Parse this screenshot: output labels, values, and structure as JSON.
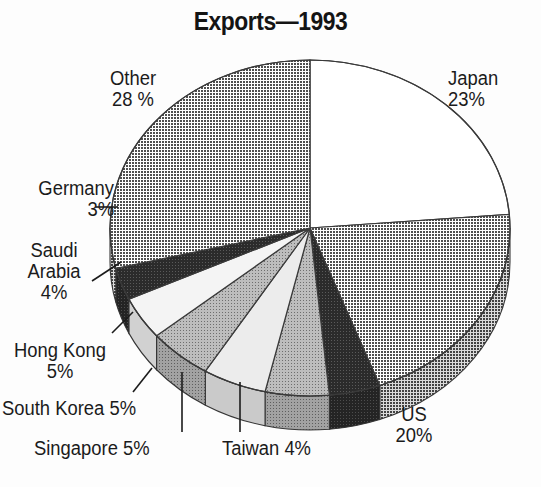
{
  "title": "Exports—1993",
  "chart_data": {
    "type": "pie",
    "title": "Exports—1993",
    "xlabel": "",
    "ylabel": "",
    "legend_position": "none",
    "grid": false,
    "unit": "%",
    "categories": [
      "Japan",
      "US",
      "Taiwan",
      "Singapore",
      "South Korea",
      "Hong Kong",
      "Saudi Arabia",
      "Germany",
      "Other"
    ],
    "values": [
      23,
      20,
      4,
      5,
      5,
      5,
      4,
      3,
      28
    ],
    "slices": [
      {
        "name": "Japan",
        "value": 23,
        "label": "Japan",
        "value_label": "23%",
        "fill": "#ffffff"
      },
      {
        "name": "US",
        "value": 20,
        "label": "US",
        "value_label": "20%",
        "fill": "#878787"
      },
      {
        "name": "Taiwan",
        "value": 4,
        "label": "Taiwan",
        "value_label": "4%",
        "fill": "#2e2e2e"
      },
      {
        "name": "Singapore",
        "value": 5,
        "label": "Singapore",
        "value_label": "5%",
        "fill": "#c9c9c9"
      },
      {
        "name": "South Korea",
        "value": 5,
        "label": "South Korea",
        "value_label": "5%",
        "fill": "#ededed"
      },
      {
        "name": "Hong Kong",
        "value": 5,
        "label": "Hong Kong",
        "value_label": "5%",
        "fill": "#b4b4b4"
      },
      {
        "name": "Saudi Arabia",
        "value": 4,
        "label": "Saudi Arabia",
        "value_label": "4%",
        "fill": "#f2f2f2"
      },
      {
        "name": "Germany",
        "value": 3,
        "label": "Germany",
        "value_label": "3%",
        "fill": "#3f3f3f"
      },
      {
        "name": "Other",
        "value": 28,
        "label": "Other",
        "value_label": "28 %",
        "fill": "#8a8a8a"
      }
    ]
  },
  "labels": {
    "japan": "Japan\n23%",
    "us": "US\n20%",
    "taiwan": "Taiwan 4%",
    "singapore": "Singapore 5%",
    "south_korea": "South Korea 5%",
    "hong_kong": "Hong Kong\n5%",
    "saudi": "Saudi\nArabia\n4%",
    "germany": "Germany\n3%",
    "other": "Other\n28 %"
  },
  "colors": {
    "background": "#fdfdfd",
    "text": "#1b1b1b",
    "outline": "#333333",
    "leader": "#1b1b1b"
  }
}
